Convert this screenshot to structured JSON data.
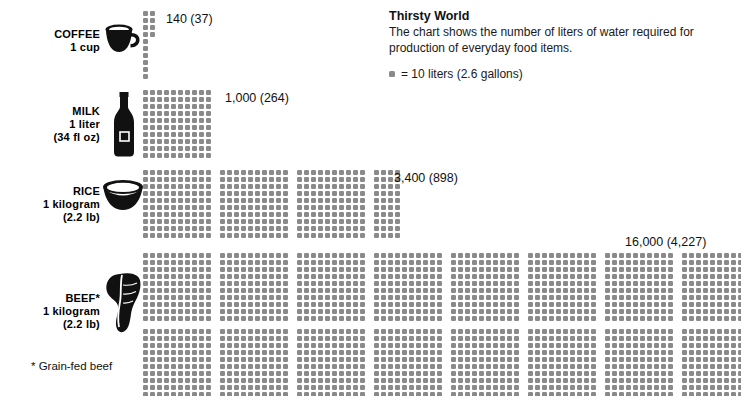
{
  "header": {
    "title": "Thirsty World",
    "description": "The chart shows the number of liters of water required for production of everyday food items.",
    "legend_label": "= 10 liters (2.6 gallons)",
    "legend_swatch_name": "dot-swatch"
  },
  "footnote": "* Grain-fed beef",
  "colors": {
    "dot": "#8a8a8a",
    "icon": "#111111",
    "text": "#111111",
    "background": "#ffffff"
  },
  "chart_data": {
    "type": "bar",
    "title": "Thirsty World",
    "subtitle": "The chart shows the number of liters of water required for production of everyday food items.",
    "xlabel": "",
    "ylabel": "",
    "unit": "liters of water",
    "dot_value": 10,
    "dot_unit_label": "= 10 liters (2.6 gallons)",
    "categories": [
      "COFFEE",
      "MILK",
      "RICE",
      "BEEF*"
    ],
    "values": [
      140,
      1000,
      3400,
      16000
    ],
    "values_gallons": [
      37,
      264,
      898,
      4227
    ],
    "dot_counts": [
      14,
      100,
      340,
      1600
    ],
    "series": [
      {
        "name": "Liters of water required",
        "values": [
          140,
          1000,
          3400,
          16000
        ]
      }
    ],
    "notes": "* Grain-fed beef"
  },
  "rows": [
    {
      "id": "coffee",
      "name_line1": "COFFEE",
      "name_line2": "1 cup",
      "name_line3": "",
      "icon": "coffee-mug-icon",
      "value_label": "140 (37)",
      "liters": 140,
      "gallons": 37,
      "dots": 14
    },
    {
      "id": "milk",
      "name_line1": "MILK",
      "name_line2": "1 liter",
      "name_line3": "(34 fl oz)",
      "icon": "milk-bottle-icon",
      "value_label": "1,000 (264)",
      "liters": 1000,
      "gallons": 264,
      "dots": 100
    },
    {
      "id": "rice",
      "name_line1": "RICE",
      "name_line2": "1 kilogram",
      "name_line3": "(2.2 lb)",
      "icon": "rice-bowl-icon",
      "value_label": "3,400 (898)",
      "liters": 3400,
      "gallons": 898,
      "dots": 340
    },
    {
      "id": "beef",
      "name_line1": "BEEF*",
      "name_line2": "1 kilogram",
      "name_line3": "(2.2 lb)",
      "icon": "beef-steak-icon",
      "value_label": "16,000 (4,227)",
      "liters": 16000,
      "gallons": 4227,
      "dots": 1600
    }
  ]
}
